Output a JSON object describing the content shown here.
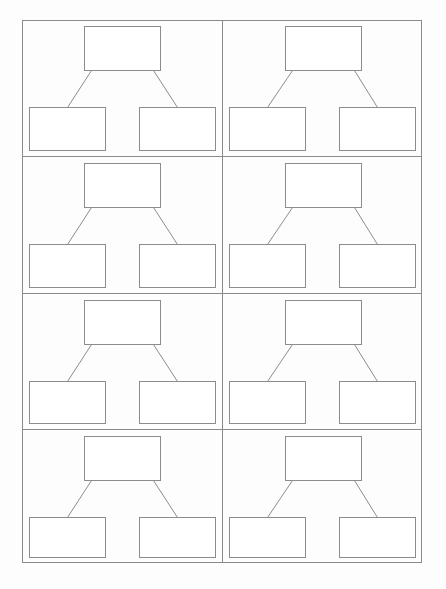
{
  "title": "",
  "template": {
    "type": "tree-diagram-worksheet",
    "columns": 2,
    "rows": 4,
    "line_color": "#8c8c8c",
    "frame_color": "#8a8a8a",
    "background": "#fdfdfd"
  },
  "cells": [
    {
      "parent": "",
      "left_child": "",
      "right_child": ""
    },
    {
      "parent": "",
      "left_child": "",
      "right_child": ""
    },
    {
      "parent": "",
      "left_child": "",
      "right_child": ""
    },
    {
      "parent": "",
      "left_child": "",
      "right_child": ""
    },
    {
      "parent": "",
      "left_child": "",
      "right_child": ""
    },
    {
      "parent": "",
      "left_child": "",
      "right_child": ""
    },
    {
      "parent": "",
      "left_child": "",
      "right_child": ""
    },
    {
      "parent": "",
      "left_child": "",
      "right_child": ""
    }
  ]
}
